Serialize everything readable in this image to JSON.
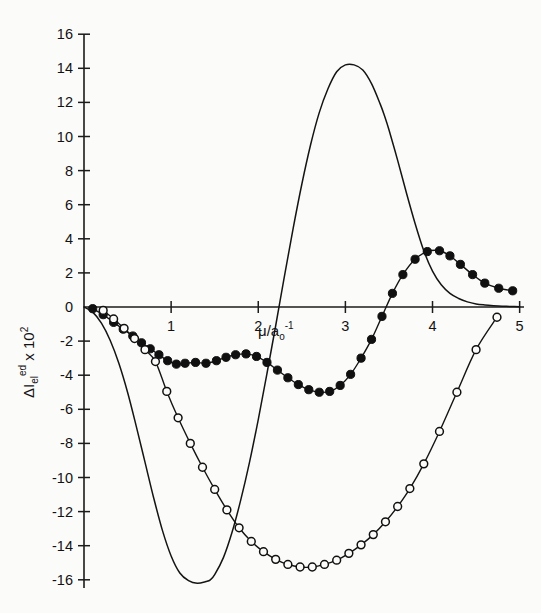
{
  "figure": {
    "background_color": "#fbfbfa",
    "ink_color": "#141414"
  },
  "chart_data": {
    "type": "line",
    "title": "",
    "subtitle": "",
    "xlabel": "μ/aₒ⁻¹",
    "xlabel_parts": {
      "mu": "μ",
      "slash": "/a",
      "sub": "o",
      "sup": "-1"
    },
    "ylabel": "Δ1ₑₗᵉᵈ x 10²",
    "ylabel_parts": {
      "delta": "Δ",
      "symbol": "I",
      "sub": "el",
      "sup": "ed",
      "times": "x 10",
      "exp": "2"
    },
    "xlim": [
      0,
      5.05
    ],
    "ylim": [
      -17.0,
      17.0
    ],
    "xticks": [
      0,
      1,
      2,
      3,
      4,
      5
    ],
    "xticklabels": [
      "",
      "1",
      "2",
      "3",
      "4",
      "5"
    ],
    "yticks": [
      -16,
      -14,
      -12,
      -10,
      -8,
      -6,
      -4,
      -2,
      0,
      2,
      4,
      6,
      8,
      10,
      12,
      14,
      16
    ],
    "yticklabels": [
      "-16",
      "-14",
      "-12",
      "-10",
      "-8",
      "-6",
      "-4",
      "-2",
      "0",
      "2",
      "4",
      "6",
      "8",
      "10",
      "12",
      "14",
      "16"
    ],
    "grid": false,
    "legend": "none",
    "series": [
      {
        "name": "solid-curve",
        "marker": "none",
        "style": "solid",
        "x": [
          0.0,
          0.1,
          0.2,
          0.3,
          0.4,
          0.5,
          0.6,
          0.7,
          0.8,
          0.9,
          1.0,
          1.1,
          1.2,
          1.3,
          1.4,
          1.45,
          1.5,
          1.6,
          1.7,
          1.8,
          1.9,
          2.0,
          2.1,
          2.2,
          2.3,
          2.4,
          2.5,
          2.6,
          2.7,
          2.8,
          2.9,
          3.0,
          3.1,
          3.2,
          3.3,
          3.4,
          3.45,
          3.5,
          3.6,
          3.7,
          3.8,
          3.9,
          4.0,
          4.1,
          4.2,
          4.3,
          4.4,
          4.5,
          4.6,
          4.7,
          4.8,
          4.9,
          5.0
        ],
        "y": [
          0.0,
          -0.3,
          -0.95,
          -1.95,
          -3.3,
          -5.0,
          -7.0,
          -9.1,
          -11.2,
          -13.1,
          -14.6,
          -15.6,
          -16.05,
          -16.2,
          -16.1,
          -16.0,
          -15.7,
          -14.7,
          -13.2,
          -11.3,
          -9.1,
          -6.6,
          -3.9,
          -1.1,
          1.8,
          4.6,
          7.2,
          9.5,
          11.4,
          12.8,
          13.8,
          14.2,
          14.2,
          13.9,
          13.1,
          11.9,
          11.2,
          10.4,
          8.6,
          6.7,
          4.9,
          3.3,
          2.1,
          1.3,
          0.8,
          0.5,
          0.3,
          0.18,
          0.12,
          0.08,
          0.05,
          0.03,
          0.02
        ]
      },
      {
        "name": "filled-circle-curve",
        "marker": "filled-circle",
        "style": "solid",
        "x": [
          0.1,
          0.22,
          0.34,
          0.45,
          0.56,
          0.66,
          0.76,
          0.86,
          0.96,
          1.06,
          1.16,
          1.28,
          1.4,
          1.52,
          1.63,
          1.74,
          1.86,
          1.98,
          2.1,
          2.22,
          2.34,
          2.46,
          2.58,
          2.7,
          2.82,
          2.94,
          3.06,
          3.18,
          3.3,
          3.42,
          3.54,
          3.66,
          3.8,
          3.94,
          4.08,
          4.2,
          4.32,
          4.46,
          4.6,
          4.76,
          4.92
        ],
        "y": [
          -0.1,
          -0.45,
          -0.9,
          -1.3,
          -1.7,
          -2.1,
          -2.45,
          -2.8,
          -3.15,
          -3.35,
          -3.3,
          -3.25,
          -3.3,
          -3.15,
          -2.95,
          -2.8,
          -2.75,
          -2.9,
          -3.25,
          -3.7,
          -4.15,
          -4.55,
          -4.85,
          -5.0,
          -4.95,
          -4.6,
          -3.95,
          -3.0,
          -1.9,
          -0.55,
          0.8,
          1.9,
          2.8,
          3.25,
          3.3,
          3.0,
          2.5,
          1.9,
          1.4,
          1.1,
          0.95
        ]
      },
      {
        "name": "open-circle-curve",
        "marker": "open-circle",
        "style": "solid",
        "x": [
          0.22,
          0.34,
          0.46,
          0.58,
          0.7,
          0.82,
          0.95,
          1.08,
          1.22,
          1.36,
          1.5,
          1.64,
          1.78,
          1.92,
          2.06,
          2.2,
          2.34,
          2.48,
          2.62,
          2.76,
          2.9,
          3.04,
          3.18,
          3.32,
          3.46,
          3.6,
          3.74,
          3.9,
          4.08,
          4.28,
          4.5,
          4.74
        ],
        "y": [
          -0.2,
          -0.7,
          -1.25,
          -1.85,
          -2.5,
          -3.2,
          -4.95,
          -6.5,
          -8.0,
          -9.4,
          -10.7,
          -11.9,
          -12.95,
          -13.75,
          -14.35,
          -14.8,
          -15.1,
          -15.25,
          -15.25,
          -15.1,
          -14.85,
          -14.45,
          -13.95,
          -13.35,
          -12.6,
          -11.7,
          -10.65,
          -9.2,
          -7.3,
          -5.0,
          -2.5,
          -0.6
        ]
      }
    ],
    "annotations": []
  }
}
